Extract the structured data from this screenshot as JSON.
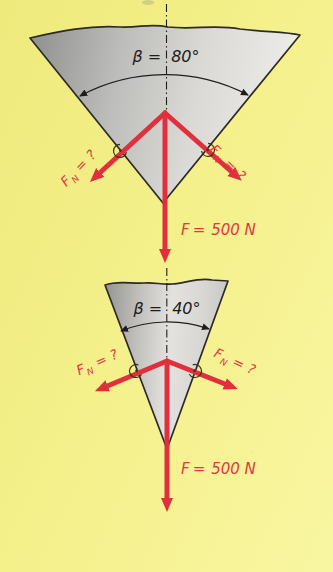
{
  "figure": {
    "type": "physics-force-diagram",
    "colors": {
      "background": "#f4f08a",
      "arrow_red": "#e0303e",
      "label_red": "#e23744",
      "wedge_outline": "#2b2a26",
      "wedge_gray_dark": "#8f8f8d",
      "wedge_gray_light": "#ecebe7",
      "centerline_black": "#1e1e1c",
      "angle_mark_dark": "#32361f"
    },
    "diagrams": [
      {
        "name": "wide-wedge-80-deg",
        "angle": {
          "symbol": "β",
          "eq": "=",
          "value": "80°"
        },
        "normal_left": {
          "symbol": "F",
          "subscript": "N",
          "eq": "=",
          "value": "?"
        },
        "normal_right": {
          "symbol": "F",
          "subscript": "N",
          "eq": "=",
          "value": "?"
        },
        "applied_force": {
          "symbol": "F",
          "eq": "=",
          "value": "500 N"
        }
      },
      {
        "name": "narrow-wedge-40-deg",
        "angle": {
          "symbol": "β",
          "eq": "=",
          "value": "40°"
        },
        "normal_left": {
          "symbol": "F",
          "subscript": "N",
          "eq": "=",
          "value": "?"
        },
        "normal_right": {
          "symbol": "F",
          "subscript": "N",
          "eq": "=",
          "value": "?"
        },
        "applied_force": {
          "symbol": "F",
          "eq": "=",
          "value": "500 N"
        }
      }
    ]
  }
}
